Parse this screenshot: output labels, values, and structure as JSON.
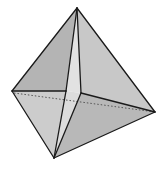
{
  "diagram": {
    "type": "geometric-solid",
    "width": 165,
    "height": 171,
    "background": "#ffffff",
    "stroke_color": "#1a1a1a",
    "vertices": {
      "apex": [
        77,
        8
      ],
      "left": [
        12,
        91
      ],
      "right": [
        155,
        112
      ],
      "bottom": [
        54,
        158
      ],
      "slit_left": [
        66,
        91
      ],
      "slit_right": [
        81,
        93
      ]
    },
    "faces": [
      {
        "name": "upper-left-face",
        "points": "77,8 12,91 66,91",
        "fill": "#b4b4b4"
      },
      {
        "name": "upper-right-face",
        "points": "77,8 81,93 155,112",
        "fill": "#c8c8c8"
      },
      {
        "name": "upper-slit-face",
        "points": "77,8 66,91 81,93",
        "fill": "#e2e2e2"
      },
      {
        "name": "lower-left-face",
        "points": "12,91 66,91 54,158",
        "fill": "#cccccc"
      },
      {
        "name": "lower-right-face",
        "points": "81,93 155,112 54,158",
        "fill": "#b8b8b8"
      },
      {
        "name": "lower-slit-face",
        "points": "66,91 81,93 54,158",
        "fill": "#dcdcdc"
      }
    ],
    "solid_edges": [
      {
        "name": "edge-apex-left",
        "from": [
          77,
          8
        ],
        "to": [
          12,
          91
        ]
      },
      {
        "name": "edge-apex-right",
        "from": [
          77,
          8
        ],
        "to": [
          155,
          112
        ]
      },
      {
        "name": "edge-left-bottom",
        "from": [
          12,
          91
        ],
        "to": [
          54,
          158
        ]
      },
      {
        "name": "edge-right-bottom",
        "from": [
          155,
          112
        ],
        "to": [
          54,
          158
        ]
      },
      {
        "name": "edge-apex-slit-left",
        "from": [
          77,
          8
        ],
        "to": [
          66,
          91
        ]
      },
      {
        "name": "edge-apex-slit-right",
        "from": [
          77,
          8
        ],
        "to": [
          81,
          93
        ]
      },
      {
        "name": "edge-left-slit-left",
        "from": [
          12,
          91
        ],
        "to": [
          66,
          91
        ]
      },
      {
        "name": "edge-slit-right-right",
        "from": [
          81,
          93
        ],
        "to": [
          155,
          112
        ]
      },
      {
        "name": "edge-slit-left-bottom",
        "from": [
          66,
          91
        ],
        "to": [
          54,
          158
        ]
      },
      {
        "name": "edge-slit-right-bottom",
        "from": [
          81,
          93
        ],
        "to": [
          54,
          158
        ]
      }
    ],
    "hidden_edges": [
      {
        "name": "hidden-edge-left-right",
        "from": [
          14,
          93
        ],
        "to": [
          155,
          112
        ]
      }
    ]
  }
}
